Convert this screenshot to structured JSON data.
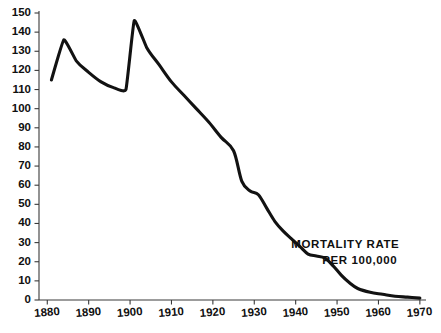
{
  "chart_data": {
    "type": "line",
    "title": "",
    "subtitle": "",
    "xlabel": "",
    "ylabel": "",
    "xlim": [
      1878,
      1971
    ],
    "ylim": [
      0,
      150
    ],
    "grid": false,
    "legend": "none",
    "y_ticks": [
      0,
      10,
      20,
      30,
      40,
      50,
      60,
      70,
      80,
      90,
      100,
      110,
      120,
      130,
      140,
      150
    ],
    "y_tick_labels": [
      "0",
      "10",
      "20",
      "30",
      "40",
      "50",
      "60",
      "70",
      "80",
      "90",
      "100",
      "110",
      "120",
      "130",
      "140",
      "150"
    ],
    "x_ticks": [
      1880,
      1890,
      1900,
      1910,
      1920,
      1930,
      1940,
      1950,
      1960,
      1970
    ],
    "x_tick_labels": [
      "1880",
      "1890",
      "1900",
      "1910",
      "1920",
      "1930",
      "1940",
      "1950",
      "1960",
      "1970"
    ],
    "annotations": [
      {
        "text": "MORTALITY RATE",
        "x": 1952,
        "y": 27
      },
      {
        "text": "PER 100,000",
        "x": 1955.5,
        "y": 19
      }
    ],
    "series": [
      {
        "name": "Mortality rate per 100,000",
        "color": "#121212",
        "x": [
          1881,
          1884,
          1887,
          1890,
          1893,
          1896,
          1899,
          1901,
          1904,
          1907,
          1910,
          1913,
          1916,
          1919,
          1922,
          1925,
          1927,
          1929,
          1931,
          1933,
          1935,
          1937,
          1939,
          1941,
          1943,
          1945,
          1947,
          1949,
          1951,
          1953,
          1955,
          1958,
          1961,
          1964,
          1967,
          1970
        ],
        "values": [
          115,
          136,
          125,
          119,
          114,
          111,
          110,
          146,
          132,
          123,
          114,
          107,
          100,
          93,
          85,
          78,
          62,
          57,
          55,
          48,
          41,
          36,
          32,
          28,
          24,
          23,
          22,
          18,
          13,
          9,
          6,
          4,
          3,
          2,
          1.5,
          1
        ]
      }
    ]
  },
  "annotation_block": {
    "line1": "MORTALITY RATE",
    "line2": "PER 100,000"
  }
}
